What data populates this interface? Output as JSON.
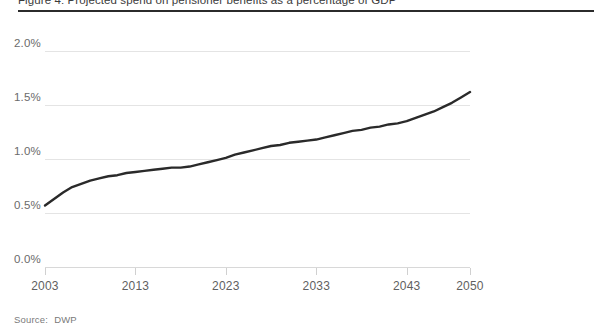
{
  "figure": {
    "title_partial": "Figure 4: Projected spend on pensioner benefits as a percentage of GDP",
    "source_label": "Source:",
    "source_value": "DWP"
  },
  "colors": {
    "line": "#2a2a2a",
    "grid": "#e4e4e4",
    "rule": "#2b2b2b",
    "tick_text": "#5f5f5f",
    "ytick_text": "#6b6b6b",
    "source_text": "#7a7a7a",
    "background": "#ffffff"
  },
  "chart_data": {
    "type": "line",
    "title": "Projected spend on pensioner benefits as a percentage of GDP",
    "xlabel": "",
    "ylabel": "",
    "xlim": [
      2003,
      2050
    ],
    "ylim": [
      0.0,
      2.0
    ],
    "grid": true,
    "legend": "none",
    "y_ticks": [
      0.0,
      0.5,
      1.0,
      1.5,
      2.0
    ],
    "y_tick_labels": [
      "0.0%",
      "0.5%",
      "1.0%",
      "1.5%",
      "2.0%"
    ],
    "x_ticks": [
      2003,
      2013,
      2023,
      2033,
      2043,
      2050
    ],
    "x_tick_labels": [
      "2003",
      "2013",
      "2023",
      "2033",
      "2043",
      "2050"
    ],
    "series": [
      {
        "name": "Pensioner benefit spend (% GDP)",
        "color": "#2a2a2a",
        "x": [
          2003,
          2004,
          2005,
          2006,
          2007,
          2008,
          2009,
          2010,
          2011,
          2012,
          2013,
          2014,
          2015,
          2016,
          2017,
          2018,
          2019,
          2020,
          2021,
          2022,
          2023,
          2024,
          2025,
          2026,
          2027,
          2028,
          2029,
          2030,
          2031,
          2032,
          2033,
          2034,
          2035,
          2036,
          2037,
          2038,
          2039,
          2040,
          2041,
          2042,
          2043,
          2044,
          2045,
          2046,
          2047,
          2048,
          2049,
          2050
        ],
        "values": [
          0.57,
          0.63,
          0.69,
          0.74,
          0.77,
          0.8,
          0.82,
          0.84,
          0.85,
          0.87,
          0.88,
          0.89,
          0.9,
          0.91,
          0.92,
          0.92,
          0.93,
          0.95,
          0.97,
          0.99,
          1.01,
          1.04,
          1.06,
          1.08,
          1.1,
          1.12,
          1.13,
          1.15,
          1.16,
          1.17,
          1.18,
          1.2,
          1.22,
          1.24,
          1.26,
          1.27,
          1.29,
          1.3,
          1.32,
          1.33,
          1.35,
          1.38,
          1.41,
          1.44,
          1.48,
          1.52,
          1.57,
          1.62
        ]
      }
    ]
  }
}
